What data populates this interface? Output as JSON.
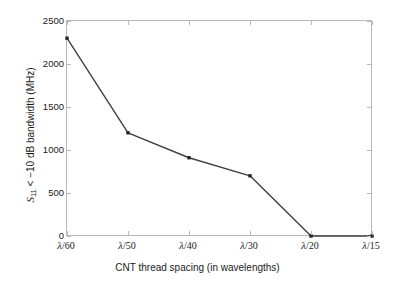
{
  "chart_data": {
    "type": "line",
    "title": "",
    "xlabel": "CNT thread spacing (in wavelengths)",
    "ylabel": "S11 < −10 dB bandwidth (MHz)",
    "ylabel_parts": {
      "symbol": "S",
      "subscript": "11",
      "rest": " < −10 dB bandwidth (MHz)"
    },
    "categories": [
      "λ/60",
      "λ/50",
      "λ/40",
      "λ/30",
      "λ/20",
      "λ/15"
    ],
    "category_parts": [
      {
        "lam": "λ",
        "frac": "/60"
      },
      {
        "lam": "λ",
        "frac": "/50"
      },
      {
        "lam": "λ",
        "frac": "/40"
      },
      {
        "lam": "λ",
        "frac": "/30"
      },
      {
        "lam": "λ",
        "frac": "/20"
      },
      {
        "lam": "λ",
        "frac": "/15"
      }
    ],
    "values": [
      2300,
      1200,
      910,
      700,
      0,
      0
    ],
    "ylim": [
      0,
      2500
    ],
    "yticks": [
      0,
      500,
      1000,
      1500,
      2000,
      2500
    ],
    "ytick_labels": [
      "0",
      "500",
      "1000",
      "1500",
      "2000",
      "2500"
    ],
    "grid": false,
    "legend": null,
    "marker": "square",
    "line_color": "#404040",
    "marker_color": "#262626",
    "axis_color": "#b9b9b9",
    "background": "#ffffff"
  }
}
